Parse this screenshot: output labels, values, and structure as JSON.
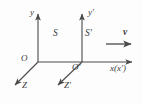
{
  "figure": {
    "background_color": "#fdfdfd",
    "line_color": "#4a4a4a",
    "text_color": "#3a3a3a",
    "width": 143,
    "height": 104
  },
  "labels": {
    "y_axis": "y",
    "y_prime_axis": "y'",
    "frame_s": "S",
    "frame_s_prime": "S'",
    "origin": "O",
    "origin_prime": "O'",
    "x_axis": "x(x')",
    "z_axis": "Z",
    "z_prime_axis": "Z'",
    "velocity": "v"
  },
  "axes": [
    {
      "name": "y-axis",
      "from": [
        38,
        62
      ],
      "to": [
        38,
        12
      ],
      "arrow": true
    },
    {
      "name": "y-prime-axis",
      "from": [
        82,
        62
      ],
      "to": [
        82,
        12
      ],
      "arrow": true
    },
    {
      "name": "x-axis",
      "from": [
        38,
        62
      ],
      "to": [
        134,
        62
      ],
      "arrow": true
    },
    {
      "name": "z-axis",
      "from": [
        38,
        62
      ],
      "to": [
        13,
        87
      ],
      "arrow": true
    },
    {
      "name": "z-prime-axis",
      "from": [
        82,
        62
      ],
      "to": [
        56,
        87
      ],
      "arrow": true
    }
  ],
  "vectors": [
    {
      "name": "velocity-arrow",
      "from": [
        106,
        44
      ],
      "to": [
        133,
        44
      ],
      "arrow": true
    }
  ]
}
